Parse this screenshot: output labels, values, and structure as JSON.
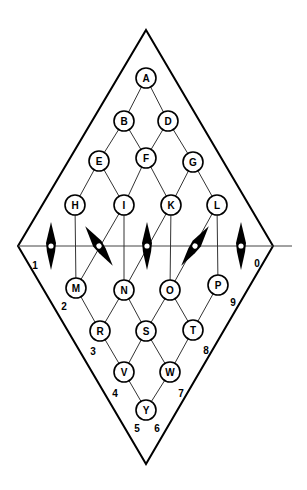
{
  "diagram": {
    "nodes": [
      {
        "id": "A",
        "label": "A"
      },
      {
        "id": "B",
        "label": "B"
      },
      {
        "id": "D",
        "label": "D"
      },
      {
        "id": "E",
        "label": "E"
      },
      {
        "id": "F",
        "label": "F"
      },
      {
        "id": "G",
        "label": "G"
      },
      {
        "id": "H",
        "label": "H"
      },
      {
        "id": "I",
        "label": "I"
      },
      {
        "id": "K",
        "label": "K"
      },
      {
        "id": "L",
        "label": "L"
      },
      {
        "id": "M",
        "label": "M"
      },
      {
        "id": "N",
        "label": "N"
      },
      {
        "id": "O",
        "label": "O"
      },
      {
        "id": "P",
        "label": "P"
      },
      {
        "id": "R",
        "label": "R"
      },
      {
        "id": "S",
        "label": "S"
      },
      {
        "id": "T",
        "label": "T"
      },
      {
        "id": "V",
        "label": "V"
      },
      {
        "id": "W",
        "label": "W"
      },
      {
        "id": "Y",
        "label": "Y"
      }
    ],
    "edges": [
      [
        "A",
        "B"
      ],
      [
        "A",
        "D"
      ],
      [
        "B",
        "E"
      ],
      [
        "B",
        "F"
      ],
      [
        "D",
        "F"
      ],
      [
        "D",
        "G"
      ],
      [
        "E",
        "H"
      ],
      [
        "E",
        "I"
      ],
      [
        "F",
        "I"
      ],
      [
        "F",
        "K"
      ],
      [
        "G",
        "K"
      ],
      [
        "G",
        "L"
      ],
      [
        "H",
        "M"
      ],
      [
        "I",
        "M"
      ],
      [
        "I",
        "N"
      ],
      [
        "K",
        "N"
      ],
      [
        "K",
        "O"
      ],
      [
        "L",
        "O"
      ],
      [
        "L",
        "P"
      ],
      [
        "M",
        "R"
      ],
      [
        "N",
        "R"
      ],
      [
        "N",
        "S"
      ],
      [
        "O",
        "S"
      ],
      [
        "O",
        "T"
      ],
      [
        "P",
        "T"
      ],
      [
        "R",
        "V"
      ],
      [
        "S",
        "V"
      ],
      [
        "S",
        "W"
      ],
      [
        "T",
        "W"
      ],
      [
        "V",
        "Y"
      ],
      [
        "W",
        "Y"
      ]
    ],
    "rotors": [
      {
        "id": "rotor-1",
        "orientation": "vertical"
      },
      {
        "id": "rotor-2",
        "orientation": "tilted-left"
      },
      {
        "id": "rotor-3",
        "orientation": "vertical"
      },
      {
        "id": "rotor-4",
        "orientation": "tilted-right"
      },
      {
        "id": "rotor-5",
        "orientation": "vertical"
      }
    ],
    "bin_labels": [
      "0",
      "1",
      "2",
      "3",
      "4",
      "5",
      "6",
      "7",
      "8",
      "9"
    ]
  }
}
